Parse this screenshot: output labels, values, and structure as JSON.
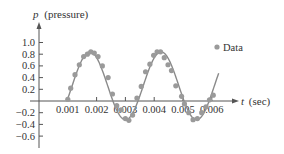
{
  "chart_data": {
    "type": "scatter",
    "title": "",
    "xlabel": "t (sec)",
    "ylabel": "p (pressure)",
    "xlabel_var": "t",
    "xlabel_unit": "(sec)",
    "ylabel_var": "p",
    "ylabel_unit": "(pressure)",
    "x_ticks": [
      "0.001",
      "0.002",
      "0.003",
      "0.004",
      "0.005",
      "0.006"
    ],
    "y_ticks": [
      "1.0",
      "0.8",
      "0.6",
      "0.4",
      "0.2",
      "−0.2",
      "−0.4",
      "−0.6"
    ],
    "xlim": [
      0,
      0.0072
    ],
    "ylim": [
      -0.7,
      1.1
    ],
    "grid": false,
    "legend": {
      "position": "right",
      "entries": [
        "Data"
      ]
    },
    "series": [
      {
        "name": "Data",
        "kind": "scatter",
        "color": "#9a9a9a",
        "x": [
          0.001,
          0.0011,
          0.00125,
          0.0014,
          0.00155,
          0.00168,
          0.0018,
          0.00192,
          0.00205,
          0.0022,
          0.0024,
          0.00255,
          0.0027,
          0.00285,
          0.003,
          0.00312,
          0.00325,
          0.0034,
          0.00355,
          0.0037,
          0.00385,
          0.00398,
          0.0041,
          0.00422,
          0.00435,
          0.00448,
          0.0046,
          0.00475,
          0.00495,
          0.00505,
          0.0052,
          0.00535,
          0.0055,
          0.00565,
          0.0058,
          0.00592,
          0.00605
        ],
        "y": [
          0.03,
          0.22,
          0.45,
          0.62,
          0.76,
          0.8,
          0.84,
          0.82,
          0.76,
          0.6,
          0.4,
          0.12,
          -0.08,
          -0.15,
          -0.3,
          -0.33,
          -0.24,
          0.05,
          0.25,
          0.5,
          0.63,
          0.78,
          0.84,
          0.84,
          0.74,
          0.62,
          0.52,
          0.26,
          0.08,
          -0.05,
          -0.2,
          -0.32,
          -0.3,
          -0.2,
          -0.1,
          0.02,
          0.1
        ]
      },
      {
        "name": "Fitted curve",
        "kind": "line",
        "color": "#8a8a8a",
        "model": "p = 0.26 + 0.58·sin(2π(t − 0.00115)/0.00247)",
        "t_range": [
          0.00098,
          0.00625
        ]
      }
    ]
  },
  "legend": {
    "label": "Data"
  },
  "axes": {
    "x_label_var": "t",
    "x_label_unit": "(sec)",
    "y_label_var": "p",
    "y_label_unit": "(pressure)"
  }
}
